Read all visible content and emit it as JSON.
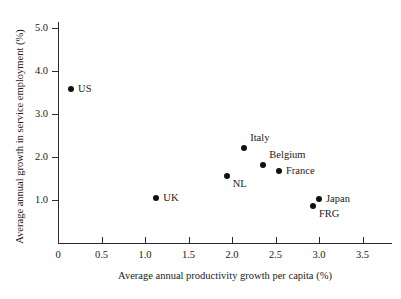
{
  "chart_data": {
    "type": "scatter",
    "title": "",
    "xlabel": "Average annual productivity growth per capita (%)",
    "ylabel": "Average annual growth in service employment (%)",
    "xlim": [
      0,
      3.85
    ],
    "ylim": [
      0,
      5.15
    ],
    "grid": false,
    "legend": "none",
    "xticks": [
      "0",
      "0.5",
      "1.0",
      "1.5",
      "2.0",
      "2.5",
      "3.0",
      "3.5"
    ],
    "xtick_values": [
      0,
      0.5,
      1.0,
      1.5,
      2.0,
      2.5,
      3.0,
      3.5
    ],
    "yticks": [
      "1.0",
      "2.0",
      "3.0",
      "4.0",
      "5.0"
    ],
    "ytick_values": [
      1.0,
      2.0,
      3.0,
      4.0,
      5.0
    ],
    "marker": "filled-circle",
    "marker_color": "#111111",
    "points": [
      {
        "label": "US",
        "x": 0.15,
        "y": 3.58,
        "label_pos": "right"
      },
      {
        "label": "UK",
        "x": 1.13,
        "y": 1.05,
        "label_pos": "right"
      },
      {
        "label": "NL",
        "x": 1.94,
        "y": 1.55,
        "label_pos": "right-below"
      },
      {
        "label": "Italy",
        "x": 2.14,
        "y": 2.21,
        "label_pos": "right-above"
      },
      {
        "label": "Belgium",
        "x": 2.36,
        "y": 1.81,
        "label_pos": "right-above"
      },
      {
        "label": "France",
        "x": 2.54,
        "y": 1.68,
        "label_pos": "right"
      },
      {
        "label": "FRG",
        "x": 2.93,
        "y": 0.85,
        "label_pos": "right-below"
      },
      {
        "label": "Japan",
        "x": 3.0,
        "y": 1.03,
        "label_pos": "right"
      }
    ]
  }
}
